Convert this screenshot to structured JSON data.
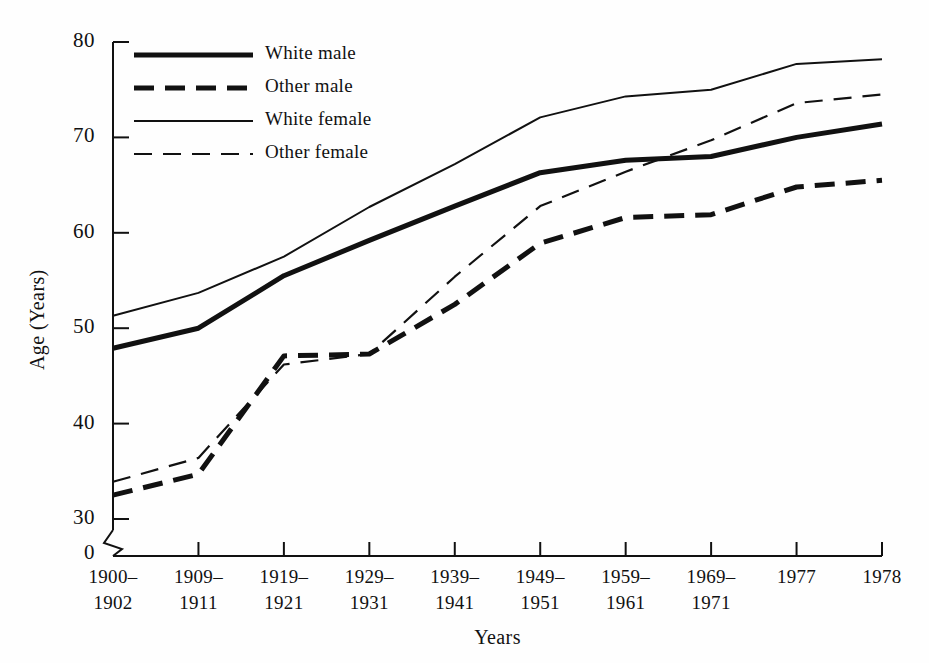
{
  "chart_data": {
    "type": "line",
    "title": "",
    "subtitle": "",
    "xlabel": "Years",
    "ylabel": "Age (Years)",
    "categories": [
      "1900-\n1902",
      "1909-\n1911",
      "1919-\n1921",
      "1929-\n1931",
      "1939-\n1941",
      "1949-\n1951",
      "1959-\n1961",
      "1969-\n1971",
      "1977",
      "1978"
    ],
    "category_lines": [
      [
        "1900–",
        "1902"
      ],
      [
        "1909–",
        "1911"
      ],
      [
        "1919–",
        "1921"
      ],
      [
        "1929–",
        "1931"
      ],
      [
        "1939–",
        "1941"
      ],
      [
        "1949–",
        "1951"
      ],
      [
        "1959–",
        "1961"
      ],
      [
        "1969–",
        "1971"
      ],
      [
        "1977",
        ""
      ],
      [
        "1978",
        ""
      ]
    ],
    "ylim": [
      30,
      80
    ],
    "yticks": [
      30,
      40,
      50,
      60,
      70,
      80
    ],
    "ytick_labels": [
      "30",
      "40",
      "50",
      "60",
      "70",
      "80"
    ],
    "y_origin_label": "0",
    "axis_break": true,
    "grid": false,
    "legend_position": "top-left",
    "series": [
      {
        "name": "White male",
        "style": "solid-thick",
        "values": [
          47.9,
          50.0,
          55.5,
          59.2,
          62.8,
          66.3,
          67.6,
          68.0,
          70.0,
          71.4
        ]
      },
      {
        "name": "Other male",
        "style": "dashed-thick",
        "values": [
          32.5,
          34.7,
          47.1,
          47.3,
          52.5,
          58.9,
          61.6,
          61.9,
          64.8,
          65.5
        ]
      },
      {
        "name": "White female",
        "style": "solid-thin",
        "values": [
          51.3,
          53.7,
          57.5,
          62.7,
          67.2,
          72.1,
          74.3,
          75.0,
          77.7,
          78.2
        ]
      },
      {
        "name": "Other female",
        "style": "dashed-thin",
        "values": [
          33.9,
          36.4,
          46.2,
          47.3,
          55.4,
          62.8,
          66.4,
          69.7,
          73.6,
          74.5
        ]
      }
    ]
  },
  "legend": {
    "entries": [
      {
        "label": "White male",
        "style": "solid-thick"
      },
      {
        "label": "Other male",
        "style": "dashed-thick"
      },
      {
        "label": "White female",
        "style": "solid-thin"
      },
      {
        "label": "Other female",
        "style": "dashed-thin"
      }
    ]
  },
  "colors": {
    "line": "#111111",
    "axis": "#111111",
    "background": "#fefefe"
  }
}
